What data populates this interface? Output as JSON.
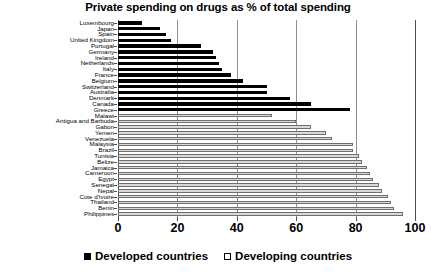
{
  "chart_data": {
    "type": "bar",
    "orientation": "horizontal",
    "title": "Private spending on drugs as % of total spending",
    "xlabel": "",
    "ylabel": "",
    "xlim": [
      0,
      100
    ],
    "xticks": [
      0,
      20,
      40,
      60,
      80,
      100
    ],
    "grid": true,
    "legend_position": "bottom-center",
    "series": [
      {
        "name": "Developed countries",
        "color": "#000000"
      },
      {
        "name": "Developing countries",
        "color": "#d9d9d9"
      }
    ],
    "categories": [
      "Luxembourg",
      "Japan",
      "Spain",
      "United  Kingdom",
      "Portugal",
      "Germany",
      "Ireland",
      "Netherlands",
      "Italy",
      "France",
      "Belgium",
      "Switzerland",
      "Australia",
      "Denmark",
      "Canada",
      "Greece",
      "Malawi",
      "Antigua and Barbuda",
      "Gabon",
      "Yemen",
      "Venezuela",
      "Malaysia",
      "Brazil",
      "Tunisia",
      "Belize",
      "Jamaica",
      "Cameroon",
      "Egypt",
      "Senegal",
      "Nepal",
      "Cote d'Ivoire",
      "Thailand",
      "Benin",
      "Philippines"
    ],
    "values": [
      8,
      14,
      16,
      18,
      28,
      32,
      33,
      34,
      35,
      38,
      42,
      50,
      50,
      58,
      65,
      78,
      52,
      60,
      65,
      70,
      72,
      79,
      79,
      81,
      82,
      84,
      85,
      86,
      88,
      89,
      91,
      92,
      93,
      96
    ],
    "groups": [
      "Developed countries",
      "Developed countries",
      "Developed countries",
      "Developed countries",
      "Developed countries",
      "Developed countries",
      "Developed countries",
      "Developed countries",
      "Developed countries",
      "Developed countries",
      "Developed countries",
      "Developed countries",
      "Developed countries",
      "Developed countries",
      "Developed countries",
      "Developed countries",
      "Developing countries",
      "Developing countries",
      "Developing countries",
      "Developing countries",
      "Developing countries",
      "Developing countries",
      "Developing countries",
      "Developing countries",
      "Developing countries",
      "Developing countries",
      "Developing countries",
      "Developing countries",
      "Developing countries",
      "Developing countries",
      "Developing countries",
      "Developing countries",
      "Developing countries",
      "Developing countries"
    ]
  },
  "legend": {
    "items": [
      {
        "label": "Developed countries",
        "swatch": "filled-square-black"
      },
      {
        "label": "Developing countries",
        "swatch": "open-square"
      }
    ]
  }
}
